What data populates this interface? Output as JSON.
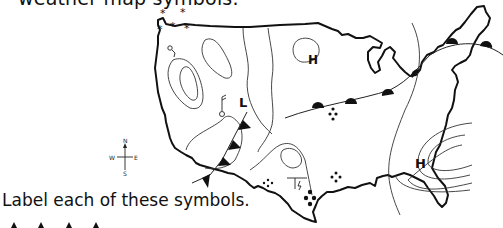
{
  "page": {
    "heading": "weather map symbols.",
    "instruction": "Label each of these symbols."
  },
  "map": {
    "pressure_systems": [
      {
        "label": "H",
        "region": "north-central"
      },
      {
        "label": "L",
        "region": "southwest"
      },
      {
        "label": "H",
        "region": "southeast"
      }
    ],
    "compass": {
      "north": "N",
      "south": "S",
      "east": "E",
      "west": "W"
    },
    "symbols": [
      "snow-asterisks",
      "cold-front-triangles",
      "warm-front-semicircles",
      "rain-dots",
      "thunderstorm-symbol",
      "wind-barb-station",
      "isobar-lines"
    ]
  },
  "exercise": {
    "symbol_row": [
      "cold-front-triangle",
      "cold-front-triangle",
      "cold-front-triangle",
      "cold-front-triangle"
    ]
  },
  "colors": {
    "ink": "#111111",
    "background": "#ffffff",
    "thin_line": "#333333"
  }
}
